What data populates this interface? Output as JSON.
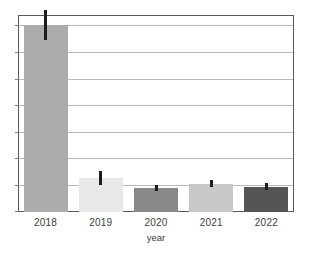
{
  "chart_data": {
    "type": "bar",
    "title": "",
    "subtitle": "",
    "xlabel": "year",
    "ylabel": "",
    "categories": [
      "2018",
      "2019",
      "2020",
      "2021",
      "2022"
    ],
    "values": [
      6.65,
      1.2,
      0.85,
      1.0,
      0.9
    ],
    "errors": [
      0.53,
      0.24,
      0.1,
      0.12,
      0.12
    ],
    "error_low": [
      6.12,
      0.96,
      0.75,
      0.88,
      0.78
    ],
    "error_high": [
      7.18,
      1.44,
      0.95,
      1.12,
      1.02
    ],
    "bar_colors": [
      "#ababab",
      "#e8e8e8",
      "#888888",
      "#c8c8c8",
      "#555555"
    ],
    "error_color": "#1d1d1d",
    "ylim": [
      0,
      7.0
    ],
    "yticks": [
      0,
      1,
      2,
      3,
      4,
      5,
      6,
      7
    ],
    "ytick_labels": [
      "",
      "",
      "",
      "",
      "",
      "",
      "",
      ""
    ],
    "grid": true,
    "grid_axis": "y",
    "grid_color": "#b9b9b9",
    "frame_color": "#5a5a5a",
    "legend": false,
    "legend_position": "none",
    "annotations": [],
    "error_bar_style": "vertical-line-no-caps",
    "bar_count": 5
  },
  "axes": {
    "x": {
      "label": "year",
      "tick_labels": [
        "2018",
        "2019",
        "2020",
        "2021",
        "2022"
      ]
    },
    "y": {
      "label": "",
      "tick_labels": [
        "",
        "",
        "",
        "",
        "",
        "",
        "",
        ""
      ]
    }
  }
}
